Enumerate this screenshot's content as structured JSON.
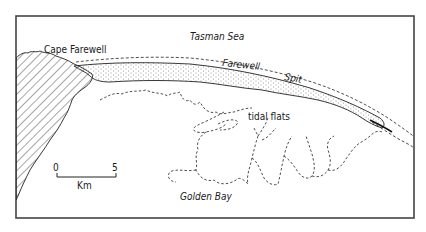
{
  "map": {
    "labels": {
      "cape": "Cape Farewell",
      "sea": "Tasman Sea",
      "spit_word1": "Farewell",
      "spit_word2": "Spit",
      "tidal": "tidal flats",
      "bay": "Golden Bay"
    },
    "scale_bar": {
      "start": "0",
      "end": "5",
      "unit": "Km"
    },
    "legend_styles": {
      "land_hatch": "diagonal hatching",
      "spit_fill": "stippled",
      "tidal_flats_boundary": "dashed line",
      "low_water_line": "dashed line"
    },
    "colors": {
      "ink": "#1a1a1a",
      "paper": "#ffffff",
      "frame": "#444444"
    }
  }
}
